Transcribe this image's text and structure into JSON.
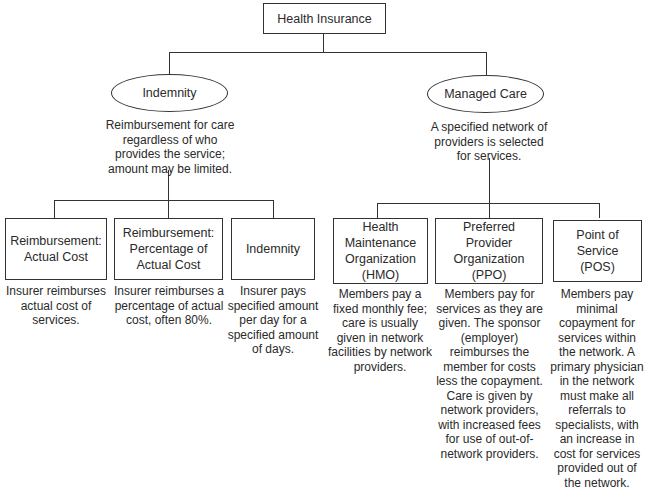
{
  "root": {
    "label": "Health Insurance"
  },
  "branches": [
    {
      "label": "Indemnity",
      "description": "Reimbursement for care regardless of who provides the service; amount may be limited.",
      "children": [
        {
          "label": "Reimbursement: Actual Cost",
          "description": "Insurer reimburses actual cost of services."
        },
        {
          "label": "Reimbursement: Percentage of Actual Cost",
          "description": "Insurer reimburses a percentage of actual cost, often 80%."
        },
        {
          "label": "Indemnity",
          "description": "Insurer pays specified amount per day for a specified amount of days."
        }
      ]
    },
    {
      "label": "Managed Care",
      "description": "A specified network of providers is selected for services.",
      "children": [
        {
          "label": "Health Maintenance Organization (HMO)",
          "description": "Members pay a fixed monthly fee; care is usually given in network facilities by network providers."
        },
        {
          "label": "Preferred Provider Organization (PPO)",
          "description": "Members pay for services as they are given. The sponsor (employer) reimburses the member for costs less the copayment. Care is given by network providers, with increased fees for use of out-of-network providers."
        },
        {
          "label": "Point of Service (POS)",
          "description": "Members pay minimal copayment for services within the network. A primary physician in the network must make all referrals to specialists, with an increase in cost for services provided out of the network."
        }
      ]
    }
  ]
}
